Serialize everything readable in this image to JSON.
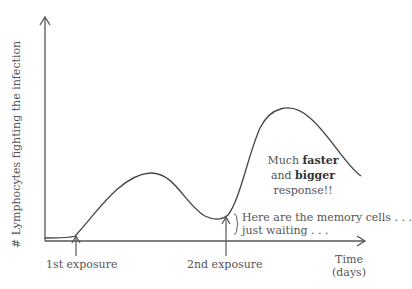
{
  "diagram": {
    "y_axis_label": "# Lymphocytes fighting the infection",
    "x_axis_label_line1": "Time",
    "x_axis_label_line2": "(days)",
    "markers": [
      {
        "label": "1st exposure"
      },
      {
        "label": "2nd exposure"
      }
    ],
    "annotation_response": {
      "part1": "Much ",
      "bold1": "faster",
      "part2": "and ",
      "bold2": "bigger",
      "part3": "response!!"
    },
    "annotation_memory": {
      "line1": "Here are the memory cells . . .",
      "line2": "just waiting . . ."
    },
    "colors": {
      "line": "#555555",
      "text": "#555555"
    }
  }
}
